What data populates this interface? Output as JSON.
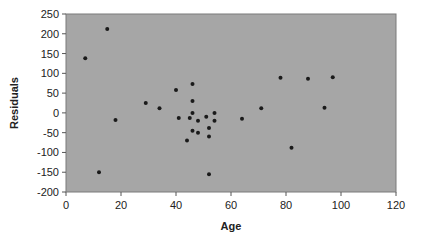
{
  "chart_data": {
    "type": "scatter",
    "title": "",
    "xlabel": "Age",
    "ylabel": "Residuals",
    "xlim": [
      0,
      120
    ],
    "ylim": [
      -200,
      250
    ],
    "x_ticks": [
      0,
      20,
      40,
      60,
      80,
      100,
      120
    ],
    "y_ticks": [
      250,
      200,
      150,
      100,
      50,
      0,
      -50,
      -100,
      -150,
      -200
    ],
    "grid": false,
    "legend": null,
    "plot_background": "#a6a6a6",
    "marker_color": "#1a1a1a",
    "series": [
      {
        "name": "Residuals",
        "points": [
          [
            7,
            138
          ],
          [
            15,
            212
          ],
          [
            18,
            -18
          ],
          [
            12,
            -150
          ],
          [
            29,
            25
          ],
          [
            34,
            12
          ],
          [
            40,
            58
          ],
          [
            46,
            73
          ],
          [
            46,
            30
          ],
          [
            46,
            0
          ],
          [
            41,
            -13
          ],
          [
            45,
            -13
          ],
          [
            48,
            -20
          ],
          [
            51,
            -10
          ],
          [
            54,
            0
          ],
          [
            54,
            -20
          ],
          [
            46,
            -45
          ],
          [
            48,
            -50
          ],
          [
            52,
            -38
          ],
          [
            52,
            -60
          ],
          [
            44,
            -70
          ],
          [
            52,
            -155
          ],
          [
            64,
            -15
          ],
          [
            71,
            12
          ],
          [
            78,
            89
          ],
          [
            82,
            -88
          ],
          [
            88,
            86
          ],
          [
            94,
            13
          ],
          [
            97,
            90
          ]
        ]
      }
    ]
  }
}
